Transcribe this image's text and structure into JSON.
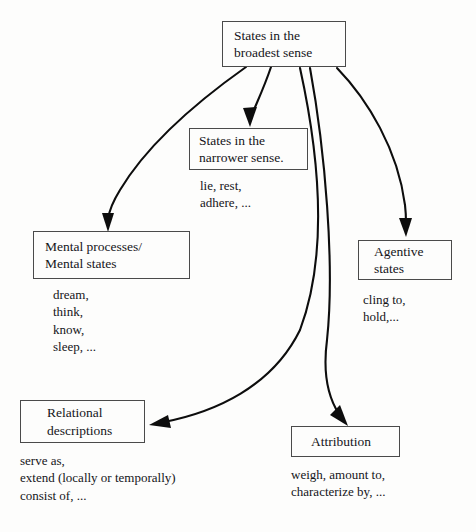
{
  "diagram": {
    "nodes": {
      "root": {
        "label": "States in the\nbroadest sense"
      },
      "narrower": {
        "label": "States in the\nnarrower sense."
      },
      "mental": {
        "label": "Mental processes/\nMental states"
      },
      "agentive": {
        "label": "Agentive\nstates"
      },
      "relational": {
        "label": "Relational\ndescriptions"
      },
      "attribution": {
        "label": "Attribution"
      }
    },
    "examples": {
      "narrower": "lie, rest,\nadhere, ...",
      "mental": "dream,\nthink,\nknow,\nsleep, ...",
      "agentive": "cling to,\nhold,...",
      "relational": "serve as,\nextend (locally or temporally)\nconsist of, ...",
      "attribution": "weigh, amount to,\ncharacterize by, ..."
    },
    "edges": [
      {
        "from": "root",
        "to": "mental"
      },
      {
        "from": "root",
        "to": "narrower"
      },
      {
        "from": "root",
        "to": "relational"
      },
      {
        "from": "root",
        "to": "attribution"
      },
      {
        "from": "root",
        "to": "agentive"
      }
    ],
    "colors": {
      "background": "#fdfdfc",
      "box_border": "#4a4a4a",
      "arrow": "#0d0d0d",
      "text": "#15151a"
    }
  }
}
